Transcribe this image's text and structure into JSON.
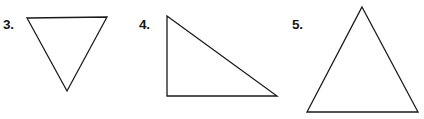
{
  "canvas": {
    "width": 424,
    "height": 119,
    "background_color": "#ffffff",
    "stroke_color": "#1a1a1a",
    "stroke_width": 1.3
  },
  "items": [
    {
      "label": "3.",
      "shape_name": "inverted-triangle",
      "description": "downward-pointing triangle",
      "points": "27,18 107,17 67,91",
      "label_x": 3,
      "label_y": 18
    },
    {
      "label": "4.",
      "shape_name": "right-triangle",
      "description": "right triangle with right angle at lower left",
      "points": "167,16 167,96 277,96",
      "label_x": 139,
      "label_y": 18
    },
    {
      "label": "5.",
      "shape_name": "upright-triangle",
      "description": "upward-pointing isosceles triangle",
      "points": "362,7 418,112 307,112",
      "label_x": 292,
      "label_y": 18
    }
  ]
}
